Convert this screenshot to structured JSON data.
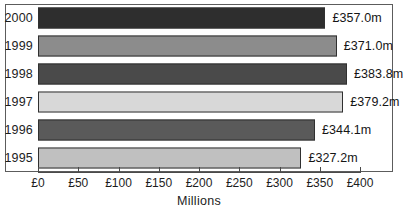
{
  "chart_data": {
    "type": "bar",
    "orientation": "horizontal",
    "title": "",
    "xlabel": "Millions",
    "ylabel": "",
    "categories": [
      "2000",
      "1999",
      "1998",
      "1997",
      "1996",
      "1995"
    ],
    "values": [
      357.0,
      371.0,
      383.8,
      379.2,
      344.1,
      327.2
    ],
    "value_labels": [
      "£357.0m",
      "£371.0m",
      "£383.8m",
      "£379.2m",
      "£344.1m",
      "£327.2m"
    ],
    "bar_colors": [
      "#2e2e2e",
      "#8c8c8c",
      "#4a4a4a",
      "#d8d8d8",
      "#5a5a5a",
      "#c0c0c0"
    ],
    "xlim": [
      0,
      400
    ],
    "xticks": [
      0,
      50,
      100,
      150,
      200,
      250,
      300,
      350,
      400
    ],
    "xtick_labels": [
      "£0",
      "£50",
      "£100",
      "£150",
      "£200",
      "£250",
      "£300",
      "£350",
      "£400"
    ],
    "grid": false,
    "legend": null,
    "currency_symbol": "£",
    "unit_suffix": "m"
  }
}
